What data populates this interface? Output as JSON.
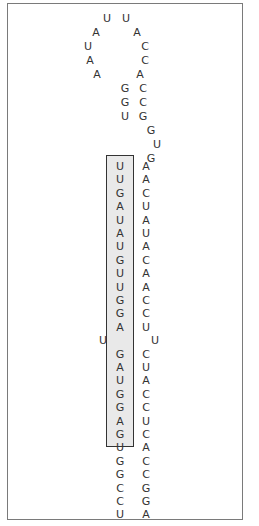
{
  "figure": {
    "type": "RNA stem-loop (hairpin) secondary structure",
    "colors": {
      "text": "#333333",
      "frame": "#7a7a7a",
      "highlight_fill": "#e9e9e9",
      "highlight_border": "#333333"
    }
  },
  "loop": {
    "nucleotides": [
      {
        "base": "U",
        "x": 107,
        "y": 19
      },
      {
        "base": "U",
        "x": 126,
        "y": 19
      },
      {
        "base": "A",
        "x": 96,
        "y": 33
      },
      {
        "base": "A",
        "x": 137,
        "y": 33
      },
      {
        "base": "U",
        "x": 88,
        "y": 47
      },
      {
        "base": "C",
        "x": 145,
        "y": 47
      },
      {
        "base": "A",
        "x": 90,
        "y": 61
      },
      {
        "base": "C",
        "x": 145,
        "y": 61
      },
      {
        "base": "A",
        "x": 97,
        "y": 75
      },
      {
        "base": "A",
        "x": 140,
        "y": 75
      },
      {
        "base": "G",
        "x": 125,
        "y": 89
      },
      {
        "base": "C",
        "x": 143,
        "y": 89
      },
      {
        "base": "G",
        "x": 125,
        "y": 103
      },
      {
        "base": "C",
        "x": 143,
        "y": 103
      },
      {
        "base": "U",
        "x": 125,
        "y": 117
      },
      {
        "base": "G",
        "x": 143,
        "y": 117
      },
      {
        "base": "G",
        "x": 151,
        "y": 131
      },
      {
        "base": "U",
        "x": 157,
        "y": 145
      },
      {
        "base": "G",
        "x": 151,
        "y": 159
      }
    ]
  },
  "stem": {
    "left_strand": [
      "U",
      "U",
      "G",
      "A",
      "U",
      "A",
      "U",
      "G",
      "U",
      "U",
      "G",
      "G",
      "A",
      "U",
      "G",
      "A",
      "U",
      "G",
      "G",
      "A",
      "G",
      "U",
      "G",
      "G",
      "C",
      "C",
      "U"
    ],
    "right_strand": [
      "A",
      "A",
      "C",
      "U",
      "A",
      "U",
      "A",
      "C",
      "A",
      "A",
      "C",
      "C",
      "U",
      "U",
      "C",
      "U",
      "A",
      "C",
      "C",
      "U",
      "C",
      "A",
      "C",
      "C",
      "G",
      "G",
      "A"
    ],
    "highlighted_region": {
      "strand": "left",
      "sequence": "UUGAUAUGUUGGAUGAUGGAGU"
    }
  }
}
